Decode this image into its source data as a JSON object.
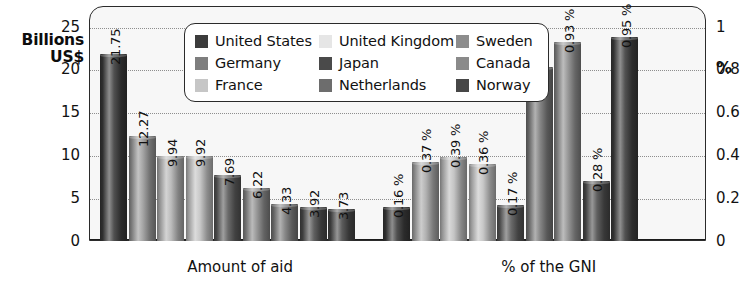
{
  "axes": {
    "left_title": "Billions\nUS$",
    "left_title_line1": "Billions",
    "left_title_line2": "US$",
    "right_title": "%",
    "left_ticks": [
      "25",
      "20",
      "15",
      "10",
      "5",
      "0"
    ],
    "right_ticks": [
      "1",
      "0.8",
      "0.6",
      "0.4",
      "0.2",
      "0"
    ]
  },
  "legend": {
    "items": [
      {
        "label": "United States",
        "color": "#3c3c3c"
      },
      {
        "label": "United Kingdom",
        "color": "#e6e6e6"
      },
      {
        "label": "Sweden",
        "color": "#8d8d8d"
      },
      {
        "label": "Germany",
        "color": "#7e7e7e"
      },
      {
        "label": "Japan",
        "color": "#4a4a4a"
      },
      {
        "label": "Canada",
        "color": "#8a8a8a"
      },
      {
        "label": "France",
        "color": "#c6c6c6"
      },
      {
        "label": "Netherlands",
        "color": "#6d6d6d"
      },
      {
        "label": "Norway",
        "color": "#474747"
      }
    ]
  },
  "categories": [
    {
      "label": "Amount of aid",
      "center_pct": 24.5
    },
    {
      "label": "% of the GNI",
      "center_pct": 74.5
    }
  ],
  "chart_data": {
    "type": "bar",
    "title": "",
    "xlabel": "",
    "ylabel": "Billions US$",
    "y2label": "%",
    "grid": true,
    "legend_position": "top-center",
    "ylim": [
      0,
      27.5
    ],
    "y2lim": [
      0,
      1.1
    ],
    "yticks": [
      0,
      5,
      10,
      15,
      20,
      25
    ],
    "y2ticks": [
      0,
      0.2,
      0.4,
      0.6,
      0.8,
      1
    ],
    "categories": [
      "Amount of aid",
      "% of the GNI"
    ],
    "series_names": [
      "United States",
      "United Kingdom",
      "Sweden",
      "Germany",
      "Japan",
      "Canada",
      "France",
      "Netherlands",
      "Norway"
    ],
    "groups": [
      {
        "name": "Amount of aid",
        "unit": "Billions US$",
        "axis": "left",
        "bars": [
          {
            "country": "United States",
            "value": 21.75,
            "label": "21.75",
            "color": "#3c3c3c"
          },
          {
            "country": "United Kingdom",
            "value": 12.27,
            "label": "12.27",
            "color": "#9a9a9a"
          },
          {
            "country": "Germany",
            "value": 9.94,
            "label": "9.94",
            "color": "#b4b4b4"
          },
          {
            "country": "France",
            "value": 9.92,
            "label": "9.92",
            "color": "#c2c2c2"
          },
          {
            "country": "Japan",
            "value": 7.69,
            "label": "7.69",
            "color": "#5a5a5a"
          },
          {
            "country": "Netherlands",
            "value": 6.22,
            "label": "6.22",
            "color": "#8a8a8a"
          },
          {
            "country": "Sweden",
            "value": 4.33,
            "label": "4.33",
            "color": "#7b7b7b"
          },
          {
            "country": "Canada",
            "value": 3.92,
            "label": "3.92",
            "color": "#4e4e4e"
          },
          {
            "country": "Norway",
            "value": 3.73,
            "label": "3.73",
            "color": "#4a4a4a"
          }
        ]
      },
      {
        "name": "% of the GNI",
        "unit": "%",
        "axis": "right",
        "bars": [
          {
            "country": "United States",
            "value": 0.16,
            "label": "0.16 %",
            "color": "#3c3c3c"
          },
          {
            "country": "United Kingdom",
            "value": 0.37,
            "label": "0.37 %",
            "color": "#a8a8a8"
          },
          {
            "country": "Germany",
            "value": 0.39,
            "label": "0.39 %",
            "color": "#bdbdbd"
          },
          {
            "country": "France",
            "value": 0.36,
            "label": "0.36 %",
            "color": "#c2c2c2"
          },
          {
            "country": "Japan",
            "value": 0.17,
            "label": "0.17 %",
            "color": "#5a5a5a"
          },
          {
            "country": "Netherlands",
            "value": 0.81,
            "label": "0.81 %",
            "color": "#7a7a7a"
          },
          {
            "country": "Sweden",
            "value": 0.93,
            "label": "0.93 %",
            "color": "#8d8d8d"
          },
          {
            "country": "Canada",
            "value": 0.28,
            "label": "0.28 %",
            "color": "#4e4e4e"
          },
          {
            "country": "Norway",
            "value": 0.95,
            "label": "0.95 %",
            "color": "#3f3f3f"
          }
        ]
      }
    ]
  }
}
